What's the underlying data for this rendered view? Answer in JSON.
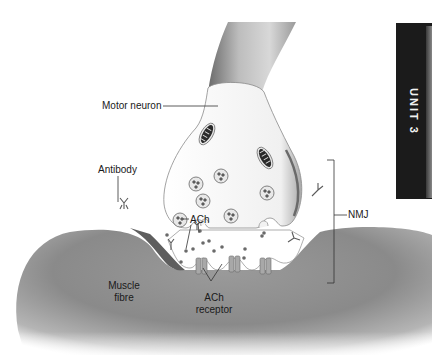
{
  "figure": {
    "labels": {
      "motor_neuron": "Motor neuron",
      "antibody": "Antibody",
      "ach": "ACh",
      "nmj": "NMJ",
      "muscle_fibre_line1": "Muscle",
      "muscle_fibre_line2": "fibre",
      "ach_receptor_line1": "ACh",
      "ach_receptor_line2": "receptor"
    },
    "side_tab": {
      "text": "UNIT 3",
      "background": "#1b1b1b",
      "text_color": "#f2f2f2"
    },
    "colors": {
      "muscle": "#8f8f8f",
      "muscle_dark": "#6e6e6e",
      "neuron_fill": "#f1f1f1",
      "axon_shade": "#9a9a9a",
      "outline": "#555555",
      "leader_line": "#333333"
    },
    "elements": {
      "mitochondria_count": 2,
      "vesicles_count": 7,
      "receptors_count": 3,
      "antibodies_count": 5
    }
  }
}
